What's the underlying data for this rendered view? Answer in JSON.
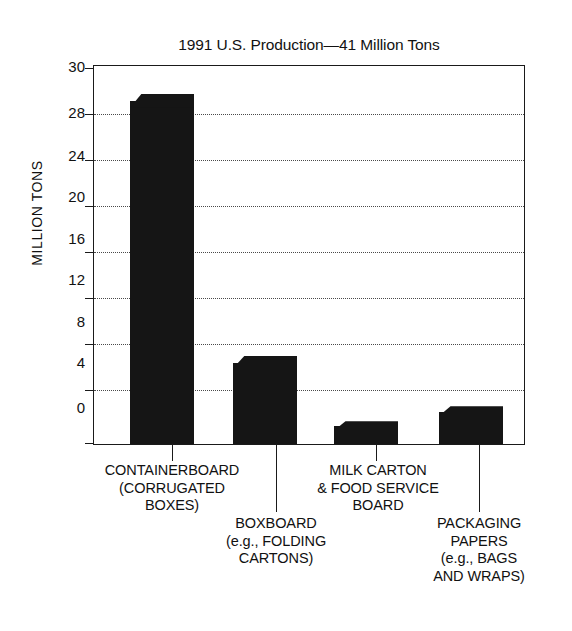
{
  "chart_data": {
    "type": "bar",
    "title": "1991 U.S. Production—41 Million Tons",
    "xlabel": "",
    "ylabel": "MILLION TONS",
    "ylim": [
      0,
      30
    ],
    "yticks": [
      0,
      4,
      8,
      12,
      16,
      20,
      24,
      28,
      30
    ],
    "ytick_labels": [
      "0",
      "4",
      "8",
      "12",
      "16",
      "20",
      "24",
      "28",
      "30"
    ],
    "gridlines": [
      4,
      8,
      12,
      16,
      20,
      24,
      28
    ],
    "grid": true,
    "legend": "none",
    "categories": [
      "CONTAINERBOARD (CORRUGATED BOXES)",
      "BOXBOARD (e.g., FOLDING CARTONS)",
      "MILK CARTON & FOOD SERVICE BOARD",
      "PACKAGING PAPERS (e.g., BAGS AND WRAPS)"
    ],
    "values": [
      27.8,
      7.0,
      1.8,
      3.0
    ],
    "bar_color": "#151515",
    "axis_color": "#1a1a1a",
    "total_label": "41 Million Tons"
  },
  "labels": {
    "containerboard": {
      "line1": "CONTAINERBOARD",
      "line2": "(CORRUGATED",
      "line3": "BOXES)"
    },
    "boxboard": {
      "line1": "BOXBOARD",
      "line2": "(e.g., FOLDING",
      "line3": "CARTONS)"
    },
    "milk_carton": {
      "line1": "MILK CARTON",
      "line2": "& FOOD SERVICE",
      "line3": "BOARD"
    },
    "packaging_papers": {
      "line1": "PACKAGING",
      "line2": "PAPERS",
      "line3": "(e.g., BAGS",
      "line4": "AND WRAPS)"
    }
  },
  "yticks": {
    "t0": "0",
    "t1": "4",
    "t2": "8",
    "t3": "12",
    "t4": "16",
    "t5": "20",
    "t6": "24",
    "t7": "28",
    "t8": "30"
  }
}
